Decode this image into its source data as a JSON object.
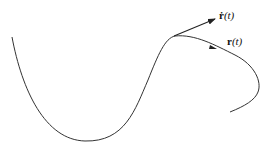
{
  "diagram": {
    "type": "parametric-curve-tangent",
    "curve_label": {
      "vector": "r",
      "arg": "(t)"
    },
    "tangent_label": {
      "vector": "ṙ",
      "arg": "(t)"
    },
    "colors": {
      "stroke": "#222222",
      "background": "#ffffff"
    }
  }
}
